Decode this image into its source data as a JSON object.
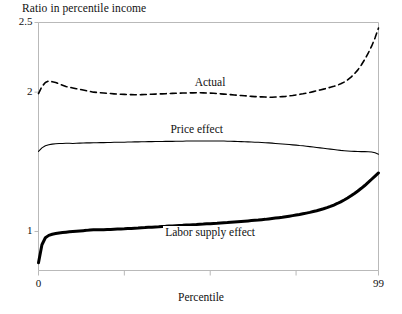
{
  "figure": {
    "y_axis_title": "Ratio in percentile income",
    "x_axis_title": "Percentile",
    "y_ticks": [
      {
        "value": 2.5,
        "label": "2.5"
      },
      {
        "value": 2.0,
        "label": "2"
      },
      {
        "value": 1.0,
        "label": "1"
      }
    ],
    "x_ticks": [
      {
        "value": 0,
        "label": "0"
      },
      {
        "value": 25,
        "label": ""
      },
      {
        "value": 50,
        "label": ""
      },
      {
        "value": 75,
        "label": ""
      },
      {
        "value": 99,
        "label": "99"
      }
    ],
    "series_labels": {
      "actual": "Actual",
      "price": "Price effect",
      "labor": "Labor supply effect"
    },
    "colors": {
      "line": "#000000",
      "frame": "#b9b9b9",
      "background": "#ffffff"
    }
  },
  "chart_data": {
    "type": "line",
    "title": "",
    "subtitle": "",
    "xlabel": "Percentile",
    "ylabel": "Ratio in percentile income",
    "xlim": [
      0,
      99
    ],
    "ylim": [
      0.72,
      2.5
    ],
    "grid": false,
    "legend_position": "inline-annotations",
    "x_ticks": [
      0,
      25,
      50,
      75,
      99
    ],
    "x_tick_labels": [
      "0",
      "",
      "",
      "",
      "99"
    ],
    "y_ticks": [
      1,
      2,
      2.5
    ],
    "y_tick_labels": [
      "1",
      "2",
      "2.5"
    ],
    "annotations": [
      {
        "text": "Actual",
        "x": 50,
        "y": 2.06
      },
      {
        "text": "Price effect",
        "x": 46,
        "y": 1.72
      },
      {
        "text": "Labor supply effect",
        "x": 50,
        "y": 0.98
      }
    ],
    "x": [
      0,
      1,
      2,
      3,
      4,
      5,
      6,
      7,
      8,
      9,
      10,
      11,
      12,
      13,
      14,
      15,
      16,
      17,
      18,
      19,
      20,
      21,
      22,
      23,
      24,
      25,
      26,
      27,
      28,
      29,
      30,
      31,
      32,
      33,
      34,
      35,
      36,
      37,
      38,
      39,
      40,
      41,
      42,
      43,
      44,
      45,
      46,
      47,
      48,
      49,
      50,
      51,
      52,
      53,
      54,
      55,
      56,
      57,
      58,
      59,
      60,
      61,
      62,
      63,
      64,
      65,
      66,
      67,
      68,
      69,
      70,
      71,
      72,
      73,
      74,
      75,
      76,
      77,
      78,
      79,
      80,
      81,
      82,
      83,
      84,
      85,
      86,
      87,
      88,
      89,
      90,
      91,
      92,
      93,
      94,
      95,
      96,
      97,
      98,
      99
    ],
    "series": [
      {
        "name": "Actual",
        "style": "dashed",
        "width": 1.6,
        "values": [
          1.99,
          2.04,
          2.07,
          2.08,
          2.075,
          2.07,
          2.06,
          2.05,
          2.04,
          2.035,
          2.03,
          2.025,
          2.02,
          2.015,
          2.01,
          2.005,
          2.0,
          1.998,
          1.996,
          1.994,
          1.992,
          1.99,
          1.988,
          1.986,
          1.985,
          1.984,
          1.983,
          1.982,
          1.981,
          1.981,
          1.982,
          1.983,
          1.984,
          1.985,
          1.986,
          1.987,
          1.988,
          1.989,
          1.99,
          1.991,
          1.992,
          1.993,
          1.994,
          1.994,
          1.995,
          1.995,
          1.996,
          1.996,
          1.995,
          1.994,
          1.993,
          1.992,
          1.99,
          1.988,
          1.986,
          1.984,
          1.982,
          1.98,
          1.978,
          1.976,
          1.974,
          1.972,
          1.97,
          1.968,
          1.967,
          1.966,
          1.965,
          1.964,
          1.964,
          1.965,
          1.966,
          1.968,
          1.97,
          1.973,
          1.976,
          1.98,
          1.984,
          1.988,
          1.993,
          1.998,
          2.004,
          2.01,
          2.016,
          2.022,
          2.028,
          2.035,
          2.042,
          2.05,
          2.06,
          2.072,
          2.088,
          2.108,
          2.132,
          2.16,
          2.195,
          2.235,
          2.28,
          2.33,
          2.39,
          2.46
        ]
      },
      {
        "name": "Price effect",
        "style": "solid",
        "width": 1.1,
        "values": [
          1.575,
          1.6,
          1.615,
          1.622,
          1.627,
          1.63,
          1.631,
          1.632,
          1.633,
          1.633,
          1.632,
          1.633,
          1.634,
          1.635,
          1.636,
          1.636,
          1.637,
          1.637,
          1.638,
          1.638,
          1.639,
          1.639,
          1.64,
          1.64,
          1.641,
          1.641,
          1.642,
          1.642,
          1.643,
          1.643,
          1.644,
          1.644,
          1.645,
          1.645,
          1.646,
          1.646,
          1.646,
          1.647,
          1.647,
          1.647,
          1.648,
          1.648,
          1.648,
          1.649,
          1.649,
          1.649,
          1.65,
          1.65,
          1.65,
          1.65,
          1.65,
          1.65,
          1.65,
          1.649,
          1.649,
          1.648,
          1.648,
          1.647,
          1.646,
          1.645,
          1.644,
          1.643,
          1.642,
          1.641,
          1.64,
          1.639,
          1.637,
          1.636,
          1.634,
          1.632,
          1.63,
          1.628,
          1.626,
          1.624,
          1.622,
          1.62,
          1.617,
          1.615,
          1.612,
          1.609,
          1.606,
          1.603,
          1.6,
          1.597,
          1.594,
          1.591,
          1.588,
          1.585,
          1.582,
          1.58,
          1.578,
          1.576,
          1.575,
          1.574,
          1.573,
          1.573,
          1.572,
          1.57,
          1.565,
          1.555
        ]
      },
      {
        "name": "Labor supply effect",
        "style": "solid",
        "width": 3.0,
        "values": [
          0.775,
          0.905,
          0.955,
          0.972,
          0.98,
          0.985,
          0.989,
          0.992,
          0.995,
          0.998,
          1.0,
          1.002,
          1.004,
          1.006,
          1.008,
          1.011,
          1.013,
          1.013,
          1.012,
          1.013,
          1.014,
          1.015,
          1.016,
          1.017,
          1.018,
          1.019,
          1.021,
          1.022,
          1.024,
          1.025,
          1.027,
          1.028,
          1.03,
          1.031,
          1.033,
          1.034,
          1.036,
          1.037,
          1.039,
          1.04,
          1.042,
          1.043,
          1.044,
          1.046,
          1.047,
          1.049,
          1.05,
          1.052,
          1.053,
          1.055,
          1.056,
          1.058,
          1.059,
          1.061,
          1.063,
          1.064,
          1.066,
          1.068,
          1.07,
          1.072,
          1.074,
          1.076,
          1.078,
          1.08,
          1.082,
          1.085,
          1.087,
          1.09,
          1.093,
          1.096,
          1.099,
          1.102,
          1.106,
          1.11,
          1.114,
          1.118,
          1.122,
          1.127,
          1.132,
          1.137,
          1.143,
          1.149,
          1.156,
          1.163,
          1.171,
          1.18,
          1.19,
          1.201,
          1.213,
          1.226,
          1.24,
          1.256,
          1.273,
          1.291,
          1.31,
          1.33,
          1.352,
          1.375,
          1.398,
          1.42
        ]
      }
    ]
  }
}
